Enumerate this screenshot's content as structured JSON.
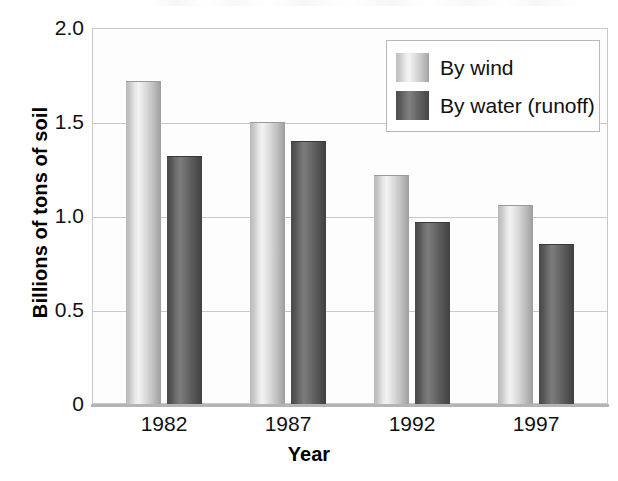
{
  "chart_data": {
    "type": "bar",
    "title": "",
    "xlabel": "Year",
    "ylabel": "Billions of tons of soil",
    "categories": [
      "1982",
      "1987",
      "1992",
      "1997"
    ],
    "series": [
      {
        "name": "By wind",
        "values": [
          1.72,
          1.5,
          1.22,
          1.06
        ],
        "color": "#d8d8d8"
      },
      {
        "name": "By water (runoff)",
        "values": [
          1.32,
          1.4,
          0.97,
          0.85
        ],
        "color": "#5e5e5e"
      }
    ],
    "ylim": [
      0,
      2.0
    ],
    "yticks": [
      "0",
      "0.5",
      "1.0",
      "1.5",
      "2.0"
    ],
    "ytick_values": [
      0,
      0.5,
      1.0,
      1.5,
      2.0
    ],
    "grid": true,
    "legend_position": "top-right"
  },
  "axes": {
    "y_title": "Billions of tons of soil",
    "x_title": "Year",
    "y_tick_labels": [
      "2.0",
      "1.5",
      "1.0",
      "0.5",
      "0"
    ],
    "x_tick_labels": [
      "1982",
      "1987",
      "1992",
      "1997"
    ]
  },
  "legend": {
    "entries": [
      {
        "label": "By wind",
        "swatch": "light-gray-gradient"
      },
      {
        "label": "By water (runoff)",
        "swatch": "dark-gray-gradient"
      }
    ]
  },
  "colors": {
    "wind_bar": "#d8d8d8",
    "water_bar": "#5e5e5e",
    "gridline": "#c9c9c9",
    "axis": "#b4b4b4",
    "text": "#111111",
    "plot_background": "#fdfdfd"
  }
}
